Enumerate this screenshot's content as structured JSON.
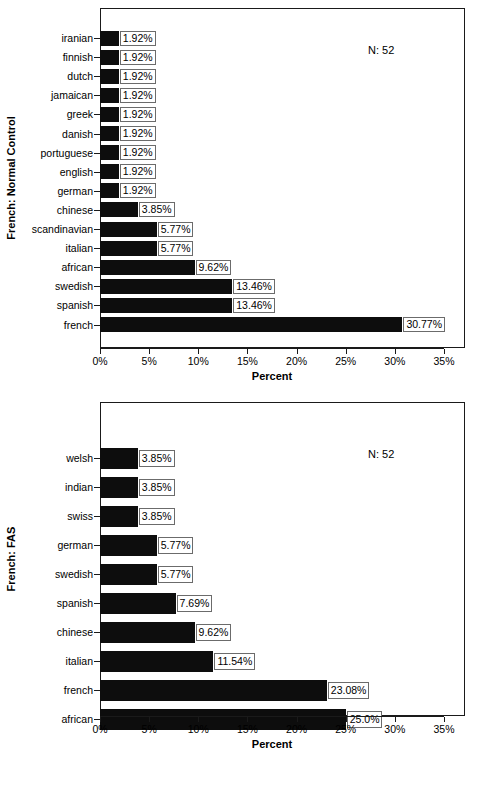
{
  "chart_data": [
    {
      "type": "bar",
      "orientation": "horizontal",
      "title": "",
      "ylabel": "French: Normal Control",
      "xlabel": "Percent",
      "annotation": "N: 52",
      "xlim": [
        0,
        35
      ],
      "tick_labels": [
        "0%",
        "5%",
        "10%",
        "15%",
        "20%",
        "25%",
        "30%",
        "35%"
      ],
      "tick_values": [
        0,
        5,
        10,
        15,
        20,
        25,
        30,
        35
      ],
      "grid": false,
      "legend": "none",
      "categories": [
        "iranian",
        "finnish",
        "dutch",
        "jamaican",
        "greek",
        "danish",
        "portuguese",
        "english",
        "german",
        "chinese",
        "scandinavian",
        "italian",
        "african",
        "swedish",
        "spanish",
        "french"
      ],
      "values": [
        1.92,
        1.92,
        1.92,
        1.92,
        1.92,
        1.92,
        1.92,
        1.92,
        1.92,
        3.85,
        5.77,
        5.77,
        9.62,
        13.46,
        13.46,
        30.77
      ],
      "data_labels": [
        "1.92%",
        "1.92%",
        "1.92%",
        "1.92%",
        "1.92%",
        "1.92%",
        "1.92%",
        "1.92%",
        "1.92%",
        "3.85%",
        "5.77%",
        "5.77%",
        "9.62%",
        "13.46%",
        "13.46%",
        "30.77%"
      ]
    },
    {
      "type": "bar",
      "orientation": "horizontal",
      "title": "",
      "ylabel": "French: FAS",
      "xlabel": "Percent",
      "annotation": "N: 52",
      "xlim": [
        0,
        35
      ],
      "tick_labels": [
        "0%",
        "5%",
        "10%",
        "15%",
        "20%",
        "25%",
        "30%",
        "35%"
      ],
      "tick_values": [
        0,
        5,
        10,
        15,
        20,
        25,
        30,
        35
      ],
      "grid": false,
      "legend": "none",
      "categories": [
        "welsh",
        "indian",
        "swiss",
        "german",
        "swedish",
        "spanish",
        "chinese",
        "italian",
        "french",
        "african"
      ],
      "values": [
        3.85,
        3.85,
        3.85,
        5.77,
        5.77,
        7.69,
        9.62,
        11.54,
        23.08,
        25.0
      ],
      "data_labels": [
        "3.85%",
        "3.85%",
        "3.85%",
        "5.77%",
        "5.77%",
        "7.69%",
        "9.62%",
        "11.54%",
        "23.08%",
        "25.0%"
      ]
    }
  ],
  "colors": {
    "bar": "#0d0d0d",
    "frame": "#1a1a1a",
    "label_box_border": "#6b6b6b",
    "background": "#ffffff"
  }
}
